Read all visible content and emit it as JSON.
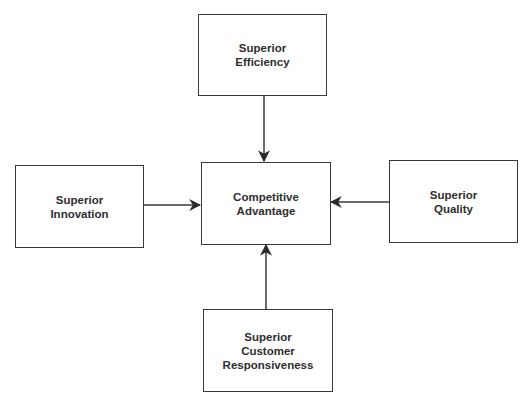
{
  "diagram": {
    "nodes": [
      {
        "id": "efficiency",
        "label": "Superior\nEfficiency"
      },
      {
        "id": "innovation",
        "label": "Superior\nInnovation"
      },
      {
        "id": "advantage",
        "label": "Competitive\nAdvantage"
      },
      {
        "id": "quality",
        "label": "Superior\nQuality"
      },
      {
        "id": "responsiveness",
        "label": "Superior\nCustomer\nResponsiveness"
      }
    ],
    "edges": [
      {
        "from": "efficiency",
        "to": "advantage"
      },
      {
        "from": "innovation",
        "to": "advantage"
      },
      {
        "from": "quality",
        "to": "advantage"
      },
      {
        "from": "responsiveness",
        "to": "advantage"
      }
    ],
    "colors": {
      "line": "#3a3a3a",
      "text": "#2e2e2e",
      "background": "#ffffff"
    }
  }
}
